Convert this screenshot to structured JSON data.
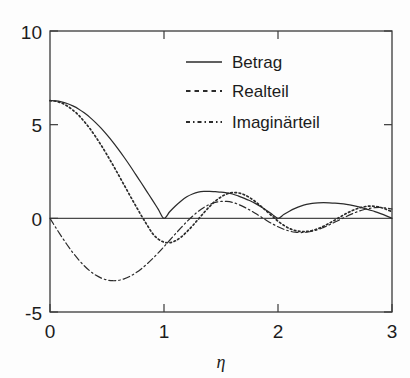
{
  "chart_data": {
    "type": "line",
    "title": "",
    "subtitle": "",
    "xlabel": "η",
    "ylabel": "",
    "xlim": [
      0,
      3
    ],
    "ylim": [
      -5,
      10
    ],
    "xticks": [
      "0",
      "1",
      "2",
      "3"
    ],
    "xtick_values": [
      0,
      1,
      2,
      3
    ],
    "yticks": [
      "10",
      "5",
      "0",
      "-5"
    ],
    "ytick_values": [
      10,
      5,
      0,
      -5
    ],
    "grid": false,
    "legend_position": "top-right-inside",
    "x": [
      0,
      0.05,
      0.1,
      0.15,
      0.2,
      0.25,
      0.3,
      0.35,
      0.4,
      0.45,
      0.5,
      0.55,
      0.6,
      0.65,
      0.7,
      0.75,
      0.8,
      0.85,
      0.9,
      0.95,
      1,
      1.05,
      1.1,
      1.15,
      1.2,
      1.25,
      1.3,
      1.35,
      1.4,
      1.45,
      1.5,
      1.55,
      1.6,
      1.65,
      1.7,
      1.75,
      1.8,
      1.85,
      1.9,
      1.95,
      2,
      2.05,
      2.1,
      2.15,
      2.2,
      2.25,
      2.3,
      2.35,
      2.4,
      2.45,
      2.5,
      2.55,
      2.6,
      2.65,
      2.7,
      2.75,
      2.8,
      2.85,
      2.9,
      2.95,
      3
    ],
    "series": [
      {
        "name": "Betrag",
        "style": "solid",
        "values": [
          6.28,
          6.27,
          6.22,
          6.13,
          6.0,
          5.84,
          5.63,
          5.39,
          5.11,
          4.8,
          4.45,
          4.08,
          3.68,
          3.26,
          2.82,
          2.36,
          1.9,
          1.43,
          0.96,
          0.48,
          0.0,
          0.35,
          0.66,
          0.93,
          1.15,
          1.3,
          1.4,
          1.44,
          1.44,
          1.42,
          1.4,
          1.36,
          1.3,
          1.2,
          1.08,
          0.95,
          0.8,
          0.62,
          0.42,
          0.21,
          0.0,
          0.2,
          0.38,
          0.53,
          0.65,
          0.74,
          0.8,
          0.83,
          0.84,
          0.83,
          0.81,
          0.78,
          0.74,
          0.69,
          0.62,
          0.54,
          0.45,
          0.36,
          0.25,
          0.13,
          0.0
        ]
      },
      {
        "name": "Realteil",
        "style": "dashed",
        "values": [
          6.28,
          6.25,
          6.16,
          6.0,
          5.78,
          5.51,
          5.17,
          4.79,
          4.36,
          3.89,
          3.39,
          2.87,
          2.33,
          1.78,
          1.23,
          0.69,
          0.16,
          -0.34,
          -0.81,
          -1.11,
          -1.27,
          -1.3,
          -1.2,
          -1.0,
          -0.72,
          -0.4,
          -0.05,
          0.3,
          0.63,
          0.92,
          1.14,
          1.3,
          1.37,
          1.36,
          1.27,
          1.11,
          0.9,
          0.65,
          0.38,
          0.11,
          -0.15,
          -0.37,
          -0.54,
          -0.65,
          -0.7,
          -0.7,
          -0.65,
          -0.55,
          -0.42,
          -0.26,
          -0.09,
          0.09,
          0.26,
          0.41,
          0.53,
          0.61,
          0.65,
          0.64,
          0.58,
          0.48,
          0.35
        ]
      },
      {
        "name": "Imaginärteil",
        "style": "dashdot",
        "values": [
          0.0,
          -0.49,
          -0.96,
          -1.41,
          -1.83,
          -2.2,
          -2.53,
          -2.81,
          -3.03,
          -3.19,
          -3.29,
          -3.33,
          -3.31,
          -3.23,
          -3.1,
          -2.92,
          -2.7,
          -2.44,
          -2.15,
          -1.84,
          -1.51,
          -1.17,
          -0.83,
          -0.5,
          -0.18,
          0.11,
          0.37,
          0.58,
          0.74,
          0.85,
          0.9,
          0.9,
          0.85,
          0.75,
          0.61,
          0.45,
          0.27,
          0.08,
          -0.11,
          -0.29,
          -0.45,
          -0.58,
          -0.68,
          -0.74,
          -0.76,
          -0.74,
          -0.69,
          -0.6,
          -0.48,
          -0.35,
          -0.2,
          -0.05,
          0.1,
          0.24,
          0.36,
          0.46,
          0.53,
          0.57,
          0.58,
          0.55,
          0.5
        ]
      }
    ],
    "legend": [
      {
        "label": "Betrag",
        "style": "solid"
      },
      {
        "label": "Realteil",
        "style": "dashed"
      },
      {
        "label": "Imaginärteil",
        "style": "dashdot"
      }
    ]
  },
  "axes": {
    "y_tick_labels": [
      "10",
      "5",
      "0",
      "-5"
    ],
    "x_tick_labels": [
      "0",
      "1",
      "2",
      "3"
    ],
    "x_axis_label": "η"
  },
  "colors": {
    "line": "#2b2b2b",
    "axis": "#3a3a3a",
    "background": "#fdfdfd",
    "text": "#1c1c1c"
  }
}
